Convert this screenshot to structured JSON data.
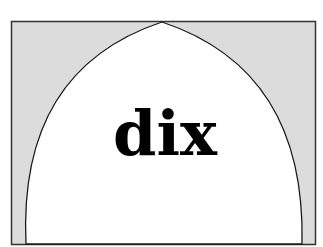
{
  "diagram": {
    "label": "dix",
    "shape": "pointed-arch",
    "colors": {
      "frame_fill": "#dcdcdc",
      "arch_fill": "#ffffff",
      "stroke": "#1a1a1a",
      "text": "#000000"
    }
  }
}
